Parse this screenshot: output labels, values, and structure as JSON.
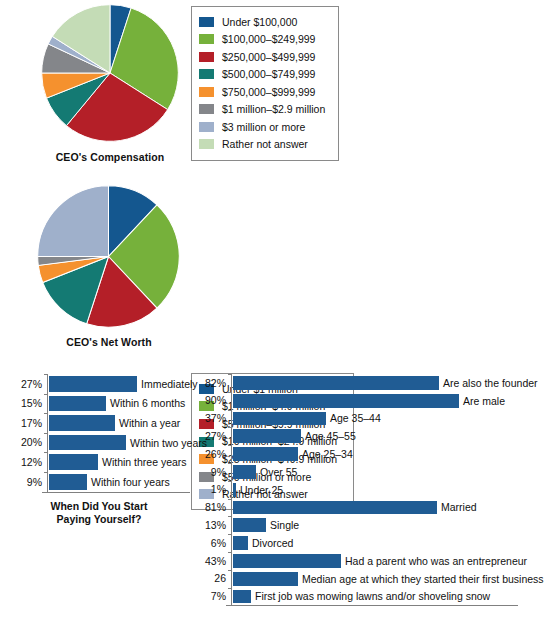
{
  "chart_data": [
    {
      "type": "pie",
      "title": "CEO's Compensation",
      "legend_position": "right",
      "categories": [
        "Under $100,000",
        "$100,000–$249,999",
        "$250,000–$499,999",
        "$500,000–$749,999",
        "$750,000–$999,999",
        "$1 million–$2.9 million",
        "$3 million or more",
        "Rather not answer"
      ],
      "values": [
        5,
        29,
        27,
        8,
        6,
        7,
        2,
        16
      ],
      "colors": [
        "#14578f",
        "#76b13b",
        "#b41f28",
        "#147a73",
        "#f5912e",
        "#84868a",
        "#9fb0cb",
        "#c4dcb6"
      ]
    },
    {
      "type": "pie",
      "title": "CEO's Net Worth",
      "legend_position": "right",
      "categories": [
        "Under $1 million",
        "$1 million–$4.9 million",
        "$5 million–$9.9 million",
        "$10 million–$24.9 million",
        "$25 million–$49.9 million",
        "$50 million or more",
        "Rather not answer"
      ],
      "values": [
        12,
        26,
        17,
        14,
        4,
        2,
        25
      ],
      "colors": [
        "#14578f",
        "#76b13b",
        "#b41f28",
        "#147a73",
        "#f5912e",
        "#84868a",
        "#9fb0cb"
      ]
    },
    {
      "type": "bar",
      "orientation": "horizontal",
      "title": "When Did You Start Paying Yourself?",
      "xlabel": "",
      "ylabel": "",
      "grid": false,
      "legend_position": "none",
      "bar_color": "#205c94",
      "categories": [
        "Immediately",
        "Within 6 months",
        "Within a year",
        "Within two years",
        "Within three years",
        "Within four years"
      ],
      "values": [
        27,
        15,
        17,
        20,
        12,
        9
      ],
      "value_labels": [
        "27%",
        "15%",
        "17%",
        "20%",
        "12%",
        "9%"
      ],
      "bar_lengths_px": [
        88,
        57,
        66,
        77,
        49,
        38
      ],
      "xlim": [
        0,
        30
      ]
    },
    {
      "type": "bar",
      "orientation": "horizontal",
      "title": "",
      "xlabel": "",
      "ylabel": "",
      "grid": false,
      "legend_position": "none",
      "bar_color": "#205c94",
      "categories": [
        "Are also the founder",
        "Are male",
        "Age 35–44",
        "Age 45–55",
        "Age 25–34",
        "Over 55",
        "Under 25",
        "Married",
        "Single",
        "Divorced",
        "Had a parent who was an entrepreneur",
        "Median age at which they started their first business",
        "First job was mowing lawns and/or shoveling snow"
      ],
      "values": [
        82,
        90,
        37,
        27,
        26,
        9,
        1,
        81,
        13,
        6,
        43,
        26,
        7
      ],
      "value_labels": [
        "82%",
        "90%",
        "37%",
        "27%",
        "26%",
        "9%",
        "1%",
        "81%",
        "13%",
        "6%",
        "43%",
        "26",
        "7%"
      ],
      "bar_lengths_px": [
        206,
        226,
        93,
        68,
        65,
        23,
        3,
        204,
        33,
        15,
        108,
        65,
        18
      ],
      "xlim": [
        0,
        100
      ]
    }
  ],
  "pies": [
    {
      "caption": "CEO's Compensation",
      "legend": [
        {
          "label": "Under $100,000",
          "color": "#14578f"
        },
        {
          "label": "$100,000–$249,999",
          "color": "#76b13b"
        },
        {
          "label": "$250,000–$499,999",
          "color": "#b41f28"
        },
        {
          "label": "$500,000–$749,999",
          "color": "#147a73"
        },
        {
          "label": "$750,000–$999,999",
          "color": "#f5912e"
        },
        {
          "label": "$1 million–$2.9 million",
          "color": "#84868a"
        },
        {
          "label": "$3 million or more",
          "color": "#9fb0cb"
        },
        {
          "label": "Rather not answer",
          "color": "#c4dcb6"
        }
      ]
    },
    {
      "caption": "CEO's Net Worth",
      "legend": [
        {
          "label": "Under $1 million",
          "color": "#14578f"
        },
        {
          "label": "$1 million–$4.9 million",
          "color": "#76b13b"
        },
        {
          "label": "$5 million–$9.9 million",
          "color": "#b41f28"
        },
        {
          "label": "$10 million–$24.9 million",
          "color": "#147a73"
        },
        {
          "label": "$25 million–$49.9 million",
          "color": "#f5912e"
        },
        {
          "label": "$50 million or more",
          "color": "#84868a"
        },
        {
          "label": "Rather not answer",
          "color": "#9fb0cb"
        }
      ]
    }
  ],
  "bar_charts": {
    "left": {
      "title_line1": "When Did You Start",
      "title_line2": "Paying Yourself?",
      "rows": [
        {
          "value": "27%",
          "label": "Immediately",
          "len": 88
        },
        {
          "value": "15%",
          "label": "Within 6 months",
          "len": 57
        },
        {
          "value": "17%",
          "label": "Within a year",
          "len": 66
        },
        {
          "value": "20%",
          "label": "Within two years",
          "len": 77
        },
        {
          "value": "12%",
          "label": "Within three years",
          "len": 49
        },
        {
          "value": "9%",
          "label": "Within four years",
          "len": 38
        }
      ]
    },
    "right": {
      "rows": [
        {
          "value": "82%",
          "label": "Are also the founder",
          "len": 206
        },
        {
          "value": "90%",
          "label": "Are male",
          "len": 226
        },
        {
          "value": "37%",
          "label": "Age 35–44",
          "len": 93
        },
        {
          "value": "27%",
          "label": "Age 45–55",
          "len": 68
        },
        {
          "value": "26%",
          "label": "Age 25–34",
          "len": 65
        },
        {
          "value": "9%",
          "label": "Over 55",
          "len": 23
        },
        {
          "value": "1%",
          "label": "Under 25",
          "len": 3
        },
        {
          "value": "81%",
          "label": "Married",
          "len": 204
        },
        {
          "value": "13%",
          "label": "Single",
          "len": 33
        },
        {
          "value": "6%",
          "label": "Divorced",
          "len": 15
        },
        {
          "value": "43%",
          "label": "Had a parent who was an entrepreneur",
          "len": 108
        },
        {
          "value": "26",
          "label": "Median age at which they started their first business",
          "len": 65
        },
        {
          "value": "7%",
          "label": "First job was mowing lawns and/or shoveling snow",
          "len": 18
        }
      ]
    }
  }
}
